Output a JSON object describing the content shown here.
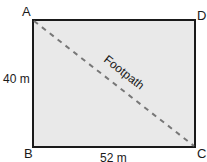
{
  "diagram": {
    "type": "rectangle-with-diagonal",
    "fill_color": "#e9e9e9",
    "stroke_color": "#1a1a1a",
    "path_color": "#777777",
    "vertices": {
      "A": "A",
      "B": "B",
      "C": "C",
      "D": "D"
    },
    "dimensions": {
      "height": "40 m",
      "width": "52 m"
    },
    "diagonal_label": "Footpath"
  }
}
